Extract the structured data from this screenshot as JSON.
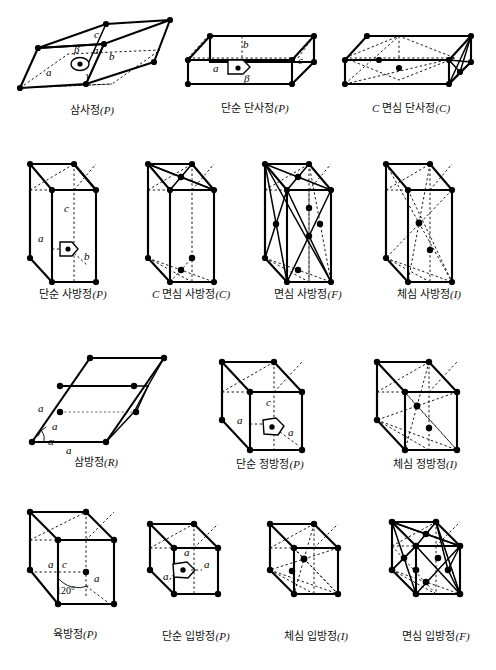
{
  "figure": {
    "rows": 4,
    "background": "#ffffff",
    "line_color": "#000000"
  },
  "lattices": [
    {
      "id": "triclinic-p",
      "caption_korean": "삼사정",
      "caption_symbol": "(P)",
      "system": "triclinic",
      "centering": "P",
      "axis_labels": [
        "a",
        "b",
        "c"
      ],
      "angle_labels": [
        "α",
        "β",
        "γ"
      ],
      "has_origin_marker": true,
      "lattice_points": 8
    },
    {
      "id": "monoclinic-p",
      "caption_korean": "단순 단사정",
      "caption_symbol": "(P)",
      "system": "monoclinic",
      "centering": "P",
      "axis_labels": [
        "a",
        "b",
        "c"
      ],
      "angle_labels": [
        "β"
      ],
      "has_origin_marker": true,
      "lattice_points": 8
    },
    {
      "id": "monoclinic-c",
      "caption_prefix": "C",
      "caption_korean": "면심 단사정",
      "caption_symbol": "(C)",
      "system": "monoclinic",
      "centering": "C",
      "axis_labels": [],
      "angle_labels": [],
      "has_origin_marker": false,
      "lattice_points": 10
    },
    {
      "id": "orthorhombic-p",
      "caption_korean": "단순 사방정",
      "caption_symbol": "(P)",
      "system": "orthorhombic",
      "centering": "P",
      "axis_labels": [
        "a",
        "b",
        "c"
      ],
      "angle_labels": [],
      "has_origin_marker": true,
      "lattice_points": 8
    },
    {
      "id": "orthorhombic-c",
      "caption_prefix": "C",
      "caption_korean": "면심 사방정",
      "caption_symbol": "(C)",
      "system": "orthorhombic",
      "centering": "C",
      "axis_labels": [],
      "angle_labels": [],
      "has_origin_marker": false,
      "lattice_points": 10
    },
    {
      "id": "orthorhombic-f",
      "caption_korean": "면심 사방정",
      "caption_symbol": "(F)",
      "system": "orthorhombic",
      "centering": "F",
      "axis_labels": [],
      "angle_labels": [],
      "has_origin_marker": false,
      "lattice_points": 14
    },
    {
      "id": "orthorhombic-i",
      "caption_korean": "체심 사방정",
      "caption_symbol": "(I)",
      "system": "orthorhombic",
      "centering": "I",
      "axis_labels": [],
      "angle_labels": [],
      "has_origin_marker": false,
      "lattice_points": 9
    },
    {
      "id": "rhombohedral-r",
      "caption_korean": "삼방정",
      "caption_symbol": "(R)",
      "system": "rhombohedral",
      "centering": "R",
      "axis_labels": [
        "a",
        "a",
        "a"
      ],
      "angle_labels": [
        "α"
      ],
      "has_origin_marker": false,
      "lattice_points": 8
    },
    {
      "id": "tetragonal-p",
      "caption_korean": "단순 정방정",
      "caption_symbol": "(P)",
      "system": "tetragonal",
      "centering": "P",
      "axis_labels": [
        "a",
        "a",
        "c"
      ],
      "angle_labels": [],
      "has_origin_marker": true,
      "lattice_points": 8
    },
    {
      "id": "tetragonal-i",
      "caption_korean": "체심 정방정",
      "caption_symbol": "(I)",
      "system": "tetragonal",
      "centering": "I",
      "axis_labels": [],
      "angle_labels": [],
      "has_origin_marker": false,
      "lattice_points": 9
    },
    {
      "id": "hexagonal-p",
      "caption_korean": "육방정",
      "caption_symbol": "(P)",
      "system": "hexagonal",
      "centering": "P",
      "axis_labels": [
        "a",
        "a",
        "c"
      ],
      "angle_labels": [
        "120°"
      ],
      "has_origin_marker": false,
      "lattice_points": 8
    },
    {
      "id": "cubic-p",
      "caption_korean": "단순 입방정",
      "caption_symbol": "(P)",
      "system": "cubic",
      "centering": "P",
      "axis_labels": [
        "a",
        "a",
        "a"
      ],
      "angle_labels": [],
      "has_origin_marker": true,
      "lattice_points": 8
    },
    {
      "id": "cubic-i",
      "caption_korean": "체심 입방정",
      "caption_symbol": "(I)",
      "system": "cubic",
      "centering": "I",
      "axis_labels": [],
      "angle_labels": [],
      "has_origin_marker": false,
      "lattice_points": 9
    },
    {
      "id": "cubic-f",
      "caption_korean": "면심 입방정",
      "caption_symbol": "(F)",
      "system": "cubic",
      "centering": "F",
      "axis_labels": [],
      "angle_labels": [],
      "has_origin_marker": false,
      "lattice_points": 14
    }
  ],
  "glyphs": {
    "a": "a",
    "b": "b",
    "c": "c",
    "alpha": "α",
    "beta": "β",
    "gamma": "γ",
    "angle_120": "120°"
  }
}
